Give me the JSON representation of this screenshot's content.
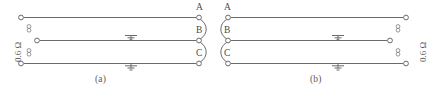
{
  "figure": {
    "type": "electrical-circuit-diagram",
    "line_color": "#6b6b6b",
    "background": "#ffffff",
    "panels": [
      {
        "id": "a",
        "caption": "(a)",
        "resistance_label": "0.6 Ω",
        "resistance_side": "left",
        "terminal_labels": [
          "A",
          "B",
          "C"
        ],
        "terminal_side": "right",
        "ground_count": 2,
        "lines": [
          {
            "name": "line-a",
            "label": "A",
            "grounded": false
          },
          {
            "name": "line-b",
            "label": "B",
            "grounded": true
          },
          {
            "name": "line-c",
            "label": "C",
            "grounded": true
          }
        ]
      },
      {
        "id": "b",
        "caption": "(b)",
        "resistance_label": "0.6 Ω",
        "resistance_side": "right",
        "terminal_labels": [
          "A",
          "B",
          "C"
        ],
        "terminal_side": "left",
        "ground_count": 2,
        "lines": [
          {
            "name": "line-a",
            "label": "A",
            "grounded": false
          },
          {
            "name": "line-b",
            "label": "B",
            "grounded": true
          },
          {
            "name": "line-c",
            "label": "C",
            "grounded": true
          }
        ]
      }
    ]
  }
}
